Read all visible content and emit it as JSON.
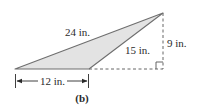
{
  "figure": {
    "caption": "(b)",
    "shape": "obtuse triangle",
    "colors": {
      "fill": "#e3e3e3",
      "stroke": "#6e6e6e",
      "dashed": "#555555",
      "text": "#2a2a2a"
    },
    "labels": {
      "long_side": "24 in.",
      "right_side": "15 in.",
      "height": "9 in.",
      "base": "12 in."
    },
    "vertices": {
      "bottom_left": [
        15,
        69
      ],
      "bottom_right": [
        89,
        69
      ],
      "apex": [
        163,
        13
      ]
    },
    "right_angle_marker": true
  }
}
